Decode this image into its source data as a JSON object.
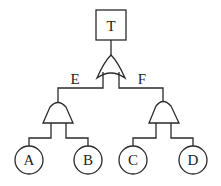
{
  "diagram": {
    "type": "fault-tree",
    "top_event": {
      "label": "T"
    },
    "top_gate": {
      "type": "OR"
    },
    "intermediate_events": [
      {
        "label": "E",
        "gate": "AND",
        "children": [
          "A",
          "B"
        ]
      },
      {
        "label": "F",
        "gate": "AND",
        "children": [
          "C",
          "D"
        ]
      }
    ],
    "basic_events": [
      {
        "label": "A"
      },
      {
        "label": "B"
      },
      {
        "label": "C"
      },
      {
        "label": "D"
      }
    ],
    "colors": {
      "stroke": "#2a2a2a",
      "background": "#ffffff"
    }
  }
}
